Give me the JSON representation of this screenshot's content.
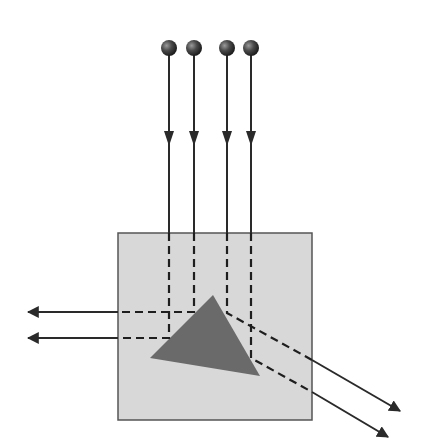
{
  "diagram": {
    "colors": {
      "background": "#ffffff",
      "box_fill": "#d8d8d8",
      "box_stroke": "#555555",
      "triangle_fill": "#6a6a6a",
      "ray": "#2a2a2a",
      "source": "#3a3a3a"
    },
    "box": {
      "x": 118,
      "y": 233,
      "width": 194,
      "height": 187
    },
    "triangle": {
      "points": [
        [
          213,
          295
        ],
        [
          150,
          358
        ],
        [
          260,
          376
        ]
      ]
    },
    "sources": [
      {
        "x": 169,
        "y": 48
      },
      {
        "x": 194,
        "y": 48
      },
      {
        "x": 227,
        "y": 48
      },
      {
        "x": 251,
        "y": 48
      }
    ],
    "rays": [
      {
        "id": "ray-1",
        "x": 169,
        "turn_y": 338,
        "exit": "left",
        "end": [
          28,
          338
        ]
      },
      {
        "id": "ray-2",
        "x": 194,
        "turn_y": 312,
        "exit": "left",
        "end": [
          28,
          312
        ]
      },
      {
        "id": "ray-3",
        "x": 227,
        "turn_y": 313,
        "exit": "down-right",
        "end": [
          400,
          412
        ]
      },
      {
        "id": "ray-4",
        "x": 251,
        "turn_y": 358,
        "exit": "down-right",
        "end": [
          388,
          437
        ]
      }
    ],
    "arrowhead_y": 140
  }
}
